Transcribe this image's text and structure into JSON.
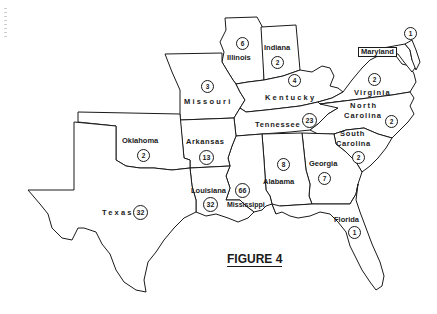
{
  "figure": {
    "caption": "FIGURE 4",
    "background_color": "#ffffff",
    "line_color": "#1a1a1a"
  },
  "states": [
    {
      "id": "maryland",
      "name": "Maryland",
      "count": "1"
    },
    {
      "id": "illinois",
      "name": "Illinois",
      "count": "6"
    },
    {
      "id": "indiana",
      "name": "Indiana",
      "count": "2"
    },
    {
      "id": "missouri",
      "name": "Missouri",
      "count": "3"
    },
    {
      "id": "kentucky",
      "name": "Kentucky",
      "count": "4"
    },
    {
      "id": "virginia",
      "name": "Virginia",
      "count": "2"
    },
    {
      "id": "north-carolina",
      "name_line1": "North",
      "name_line2": "Carolina",
      "count": "2"
    },
    {
      "id": "tennessee",
      "name": "Tennessee",
      "count": "23"
    },
    {
      "id": "oklahoma",
      "name": "Oklahoma",
      "count": "2"
    },
    {
      "id": "arkansas",
      "name": "Arkansas",
      "count": "13"
    },
    {
      "id": "south-carolina",
      "name_line1": "South",
      "name_line2": "Carolina",
      "count": "2"
    },
    {
      "id": "alabama",
      "name": "Alabama",
      "count": "8"
    },
    {
      "id": "georgia",
      "name": "Georgia",
      "count": "7"
    },
    {
      "id": "mississippi",
      "name": "Mississippi",
      "count": "66"
    },
    {
      "id": "louisiana",
      "name": "Louisiana",
      "count": "32"
    },
    {
      "id": "texas",
      "name": "Texas",
      "count": "32"
    },
    {
      "id": "florida",
      "name": "Florida",
      "count": "1"
    }
  ]
}
